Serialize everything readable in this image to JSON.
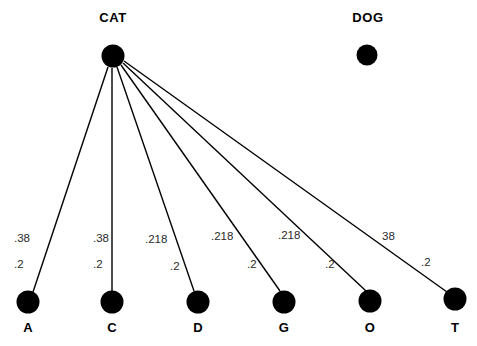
{
  "diagram": {
    "type": "node-link-graph",
    "title_nodes": [
      {
        "id": "CAT",
        "label": "CAT",
        "cx": 113,
        "cy": 56,
        "r": 11.5,
        "label_x": 113,
        "label_y": 22
      },
      {
        "id": "DOG",
        "label": "DOG",
        "cx": 367,
        "cy": 55,
        "r": 10.5,
        "label_x": 368,
        "label_y": 22
      }
    ],
    "leaf_nodes": [
      {
        "id": "A",
        "label": "A",
        "cx": 28,
        "cy": 302,
        "r": 11.5,
        "label_x": 28,
        "label_y": 332
      },
      {
        "id": "C",
        "label": "C",
        "cx": 112,
        "cy": 302,
        "r": 11.5,
        "label_x": 112,
        "label_y": 332
      },
      {
        "id": "D",
        "label": "D",
        "cx": 198,
        "cy": 302,
        "r": 11.5,
        "label_x": 198,
        "label_y": 332
      },
      {
        "id": "G",
        "label": "G",
        "cx": 284,
        "cy": 302,
        "r": 11.5,
        "label_x": 284,
        "label_y": 332
      },
      {
        "id": "O",
        "label": "O",
        "cx": 370,
        "cy": 301,
        "r": 11.5,
        "label_x": 370,
        "label_y": 332
      },
      {
        "id": "T",
        "label": "T",
        "cx": 455,
        "cy": 299,
        "r": 11.5,
        "label_x": 455,
        "label_y": 332
      }
    ],
    "edges": [
      {
        "from": "CAT",
        "to": "A",
        "x1": 108,
        "y1": 67,
        "x2": 33,
        "y2": 292,
        "upper_weight": ".38",
        "upper_x": 14,
        "upper_y": 242,
        "lower_weight": ".2",
        "lower_x": 14,
        "lower_y": 268
      },
      {
        "from": "CAT",
        "to": "C",
        "x1": 112,
        "y1": 68,
        "x2": 112,
        "y2": 291,
        "upper_weight": ".38",
        "upper_x": 93,
        "upper_y": 242,
        "lower_weight": ".2",
        "lower_x": 93,
        "lower_y": 268
      },
      {
        "from": "CAT",
        "to": "D",
        "x1": 117,
        "y1": 67,
        "x2": 194,
        "y2": 291,
        "upper_weight": ".218",
        "upper_x": 145,
        "upper_y": 243,
        "lower_weight": ".2",
        "lower_x": 170,
        "lower_y": 270
      },
      {
        "from": "CAT",
        "to": "G",
        "x1": 121,
        "y1": 65,
        "x2": 280,
        "y2": 291,
        "upper_weight": ".218",
        "upper_x": 211,
        "upper_y": 240,
        "lower_weight": ".2",
        "lower_x": 247,
        "lower_y": 268
      },
      {
        "from": "CAT",
        "to": "O",
        "x1": 123,
        "y1": 63,
        "x2": 366,
        "y2": 291,
        "upper_weight": ".218",
        "upper_x": 278,
        "upper_y": 239,
        "lower_weight": ".2",
        "lower_x": 325,
        "lower_y": 268
      },
      {
        "from": "CAT",
        "to": "T",
        "x1": 124,
        "y1": 61,
        "x2": 447,
        "y2": 292,
        "upper_weight": "38",
        "upper_x": 382,
        "upper_y": 240,
        "lower_weight": ".2",
        "lower_x": 421,
        "lower_y": 266
      }
    ],
    "colors": {
      "background": "#ffffff",
      "node": "#000000",
      "edge": "#000000",
      "label": "#000000",
      "weight": "#2a2a2a"
    }
  }
}
